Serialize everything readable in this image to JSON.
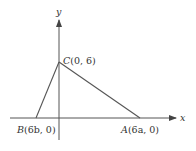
{
  "diagram": {
    "axes": {
      "x_label": "x",
      "y_label": "y"
    },
    "points": [
      {
        "id": "C",
        "name": "C",
        "coords": "(0, 6)"
      },
      {
        "id": "B",
        "name": "B",
        "coords": "(6b, 0)"
      },
      {
        "id": "A",
        "name": "A",
        "coords": "(6a, 0)"
      }
    ],
    "colors": {
      "line": "#555555",
      "text": "#333333"
    }
  }
}
